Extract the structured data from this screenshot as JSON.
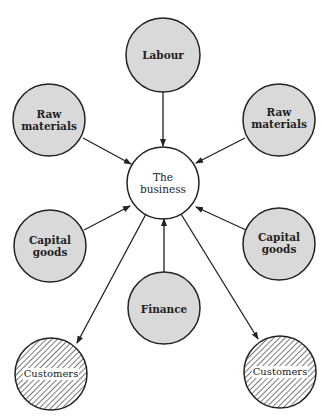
{
  "diagram": {
    "center": {
      "label_line1": "The",
      "label_line2": "business"
    },
    "inputs": [
      {
        "id": "labour",
        "line1": "Labour",
        "line2": ""
      },
      {
        "id": "raw-left",
        "line1": "Raw",
        "line2": "materials"
      },
      {
        "id": "raw-right",
        "line1": "Raw",
        "line2": "materials"
      },
      {
        "id": "capital-left",
        "line1": "Capital",
        "line2": "goods"
      },
      {
        "id": "capital-right",
        "line1": "Capital",
        "line2": "goods"
      },
      {
        "id": "finance",
        "line1": "Finance",
        "line2": ""
      }
    ],
    "outputs": [
      {
        "id": "customers-left",
        "label": "Customers"
      },
      {
        "id": "customers-right",
        "label": "Customers"
      }
    ],
    "colors": {
      "input_fill": "#d9d9d9",
      "stroke": "#222222",
      "center_fill": "#ffffff"
    }
  }
}
